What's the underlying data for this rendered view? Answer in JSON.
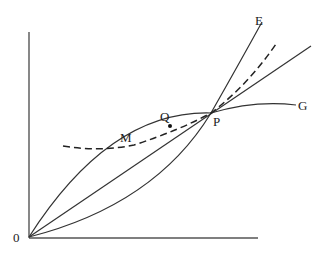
{
  "diagram": {
    "type": "economics-cost-curves",
    "labels": {
      "origin": "0",
      "curve_E": "E",
      "curve_G": "G",
      "point_P": "P",
      "point_Q": "Q",
      "point_M": "M"
    },
    "colors": {
      "line": "#333333",
      "axis": "#555555",
      "background": "#ffffff"
    },
    "elements": [
      {
        "name": "y-axis",
        "style": "solid"
      },
      {
        "name": "x-axis",
        "style": "solid"
      },
      {
        "name": "curve-E",
        "style": "solid",
        "shape": "convex, rising steeply through P"
      },
      {
        "name": "ray-from-origin",
        "style": "solid",
        "shape": "straight line through P"
      },
      {
        "name": "curve-G",
        "style": "solid",
        "shape": "concave, flattening after P"
      },
      {
        "name": "dashed-curve",
        "style": "dashed",
        "shape": "U-shaped, min near M, through P"
      }
    ]
  }
}
